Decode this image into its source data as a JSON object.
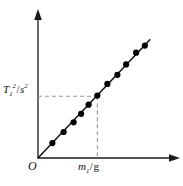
{
  "chart_data": {
    "type": "scatter",
    "title": "",
    "subtitle": "",
    "xlabel": "m₁/g",
    "ylabel": "T₁²/s²",
    "origin_label": "O",
    "grid": false,
    "legend": null,
    "xlim": [
      0,
      10
    ],
    "ylim": [
      0,
      10
    ],
    "axis_ticks": [],
    "points_label": "data-point",
    "x": [
      1.15,
      2.05,
      2.85,
      3.45,
      4.05,
      4.75,
      5.55,
      6.35,
      7.05,
      7.85,
      8.55
    ],
    "y": [
      1.15,
      2.0,
      2.75,
      3.4,
      4.1,
      4.8,
      5.7,
      6.4,
      7.2,
      8.1,
      8.65
    ],
    "fit_line": {
      "name": "best-fit-line",
      "x0": 0,
      "y0": 0,
      "x1": 8.95,
      "y1": 9.1,
      "slope": 1.017,
      "intercept": 0
    },
    "guides": [
      {
        "name": "horizontal-guide",
        "style": "dashed",
        "from": [
          0,
          4.75
        ],
        "to": [
          4.75,
          4.75
        ]
      },
      {
        "name": "vertical-guide",
        "style": "dashed",
        "from": [
          4.75,
          4.75
        ],
        "to": [
          4.75,
          0
        ]
      }
    ],
    "marked_point": [
      4.75,
      4.75
    ],
    "colors": {
      "axis": "#1a1a1a",
      "line": "#111111",
      "marker": "#000000",
      "guide": "#999999",
      "background": "#ffffff",
      "text": "#111111"
    }
  }
}
